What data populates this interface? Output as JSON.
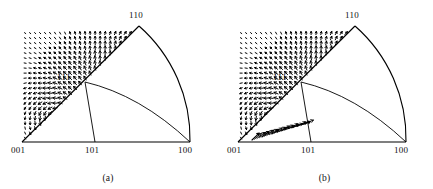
{
  "figure": {
    "background": "#ffffff",
    "line_color": "#000000",
    "arrow_color": "#000000"
  },
  "panels": [
    {
      "id": "a",
      "caption": "(a)",
      "vertex_labels": {
        "top": "110",
        "left": "001",
        "right": "100",
        "mid_bottom": "101",
        "inner": "111"
      },
      "label_positions": {
        "top": {
          "x": 139,
          "y": 12
        },
        "left": {
          "x": 12,
          "y": 150
        },
        "right": {
          "x": 178,
          "y": 150
        },
        "mid_bottom": {
          "x": 86,
          "y": 150
        },
        "inner": {
          "x": 58,
          "y": 76
        }
      }
    },
    {
      "id": "b",
      "caption": "(b)",
      "vertex_labels": {
        "top": "110",
        "left": "001",
        "right": "100",
        "mid_bottom": "101",
        "inner": "111"
      },
      "label_positions": {
        "top": {
          "x": 139,
          "y": 12
        },
        "left": {
          "x": 12,
          "y": 150
        },
        "right": {
          "x": 178,
          "y": 150
        },
        "mid_bottom": {
          "x": 86,
          "y": 150
        },
        "inner": {
          "x": 58,
          "y": 76
        }
      }
    }
  ],
  "chart_data": {
    "type": "scatter",
    "title": "",
    "subtitle": "",
    "xlabel": "",
    "ylabel": "",
    "grid": false,
    "legend": "none",
    "annotations": [
      "110",
      "111",
      "001",
      "101",
      "100",
      "(a)",
      "(b)"
    ],
    "geometry": {
      "vertex_001": {
        "x": 22,
        "y": 142
      },
      "vertex_100": {
        "x": 190,
        "y": 142
      },
      "vertex_110": {
        "x": 139,
        "y": 26
      },
      "vertex_111": {
        "x": 85,
        "y": 82
      },
      "vertex_101": {
        "x": 95,
        "y": 142
      },
      "edge_001_110": "straight",
      "edge_001_100": "straight",
      "edge_110_100": "arc-bulging-right",
      "internal_line_111_101": "straight-vertical",
      "internal_line_111_100": "arc-curving-down"
    },
    "series": [
      {
        "name": "panel-a-vector-field",
        "panel": "a",
        "style": "short dashed arrows",
        "pattern": "swirl / circulation: arrows curve around two poles, one centred in the lower-left 001-101-111 sub-triangle and one in the 110-100 lobe; arrows run tangentially along the curved 110-100 boundary.",
        "arrow_count_approx": 430
      },
      {
        "name": "panel-b-vector-field",
        "panel": "b",
        "style": "short dashed arrows plus long straight arrows",
        "pattern": "dense bundle of long straight arrows fanning from near 001/101 toward the upper-right 110-100 boundary, superposed on a short-arrow field similar to panel (a).",
        "arrow_count_approx": 430,
        "long_arrow_count_approx": 22
      }
    ]
  }
}
